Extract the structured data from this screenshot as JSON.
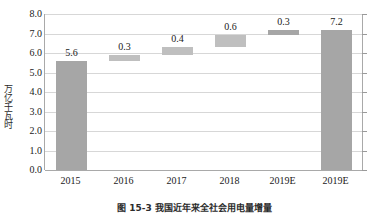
{
  "chart_data": {
    "type": "bar",
    "subtype": "waterfall",
    "title": "",
    "xlabel": "",
    "ylabel": "万亿千瓦时",
    "ylim": [
      0.0,
      8.0
    ],
    "ystep": 1.0,
    "grid": true,
    "legend": "none",
    "categories": [
      "2015",
      "2016",
      "2017",
      "2018",
      "2019E",
      "2019E"
    ],
    "yticks": [
      "8.0",
      "7.0",
      "6.0",
      "5.0",
      "4.0",
      "3.0",
      "2.0",
      "1.0",
      "0.0"
    ],
    "ytick_values": [
      8.0,
      7.0,
      6.0,
      5.0,
      4.0,
      3.0,
      2.0,
      1.0,
      0.0
    ],
    "data_labels": [
      "5.6",
      "0.3",
      "0.4",
      "0.6",
      "0.3",
      "7.2"
    ],
    "values": [
      5.6,
      0.3,
      0.4,
      0.6,
      0.3,
      7.2
    ],
    "bars": [
      {
        "category": "2015",
        "label": "5.6",
        "base": 0.0,
        "top": 5.6,
        "value": 5.6,
        "kind": "total"
      },
      {
        "category": "2016",
        "label": "0.3",
        "base": 5.6,
        "top": 5.9,
        "value": 0.3,
        "kind": "delta"
      },
      {
        "category": "2017",
        "label": "0.4",
        "base": 5.9,
        "top": 6.3,
        "value": 0.4,
        "kind": "delta"
      },
      {
        "category": "2018",
        "label": "0.6",
        "base": 6.3,
        "top": 6.9,
        "value": 0.6,
        "kind": "delta"
      },
      {
        "category": "2019E",
        "label": "0.3",
        "base": 6.9,
        "top": 7.2,
        "value": 0.3,
        "kind": "delta-dark"
      },
      {
        "category": "2019E",
        "label": "7.2",
        "base": 0.0,
        "top": 7.2,
        "value": 7.2,
        "kind": "total"
      }
    ],
    "colors": {
      "total_bar": "#a6a6a6",
      "delta_bar": "#bfbfbf",
      "delta_dark_bar": "#a6a6a6",
      "gridline": "#d7d7d7",
      "axis": "#a9a9a9",
      "plot_background": "#ffffff",
      "text": "#1a1a1a"
    }
  },
  "caption": {
    "text": "图 15-3  我国近年来全社会用电量增量"
  }
}
